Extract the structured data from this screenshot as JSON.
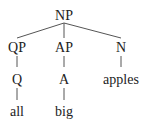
{
  "tree": {
    "root": "NP",
    "level1": [
      "QP",
      "AP",
      "N"
    ],
    "level2": [
      "Q",
      "A",
      "apples"
    ],
    "level3": [
      "all",
      "big"
    ]
  }
}
